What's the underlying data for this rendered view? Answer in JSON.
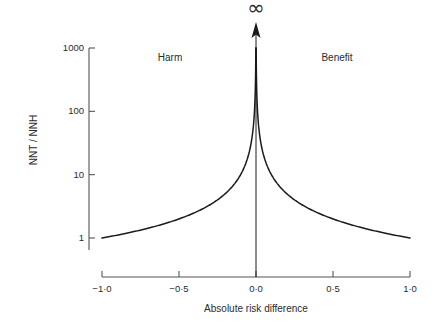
{
  "chart_data": {
    "type": "line",
    "title": "",
    "xlabel": "Absolute risk difference",
    "ylabel": "NNT / NNH",
    "xlim": [
      -1.0,
      1.0
    ],
    "ylim": [
      1,
      1000
    ],
    "yscale": "log",
    "grid": false,
    "legend": "none",
    "relationship": "NNT = 1 / |absolute risk difference|",
    "x_ticks": [
      {
        "value": -1.0,
        "label": "−1·0"
      },
      {
        "value": -0.5,
        "label": "−0·5"
      },
      {
        "value": 0.0,
        "label": "0·0"
      },
      {
        "value": 0.5,
        "label": "0·5"
      },
      {
        "value": 1.0,
        "label": "1·0"
      }
    ],
    "y_ticks": [
      {
        "value": 1,
        "label": "1"
      },
      {
        "value": 10,
        "label": "10"
      },
      {
        "value": 100,
        "label": "100"
      },
      {
        "value": 1000,
        "label": "1000"
      }
    ],
    "series": [
      {
        "name": "Harm branch",
        "points": [
          {
            "x": -1.0,
            "y": 1.0
          },
          {
            "x": -0.9,
            "y": 1.11
          },
          {
            "x": -0.8,
            "y": 1.25
          },
          {
            "x": -0.7,
            "y": 1.43
          },
          {
            "x": -0.6,
            "y": 1.67
          },
          {
            "x": -0.5,
            "y": 2.0
          },
          {
            "x": -0.4,
            "y": 2.5
          },
          {
            "x": -0.3,
            "y": 3.33
          },
          {
            "x": -0.2,
            "y": 5.0
          },
          {
            "x": -0.1,
            "y": 10.0
          },
          {
            "x": -0.05,
            "y": 20.0
          },
          {
            "x": -0.02,
            "y": 50.0
          },
          {
            "x": -0.01,
            "y": 100.0
          },
          {
            "x": -0.005,
            "y": 200.0
          },
          {
            "x": -0.002,
            "y": 500.0
          },
          {
            "x": -0.001,
            "y": 1000.0
          }
        ]
      },
      {
        "name": "Benefit branch",
        "points": [
          {
            "x": 0.001,
            "y": 1000.0
          },
          {
            "x": 0.002,
            "y": 500.0
          },
          {
            "x": 0.005,
            "y": 200.0
          },
          {
            "x": 0.01,
            "y": 100.0
          },
          {
            "x": 0.02,
            "y": 50.0
          },
          {
            "x": 0.05,
            "y": 20.0
          },
          {
            "x": 0.1,
            "y": 10.0
          },
          {
            "x": 0.2,
            "y": 5.0
          },
          {
            "x": 0.3,
            "y": 3.33
          },
          {
            "x": 0.4,
            "y": 2.5
          },
          {
            "x": 0.5,
            "y": 2.0
          },
          {
            "x": 0.6,
            "y": 1.67
          },
          {
            "x": 0.7,
            "y": 1.43
          },
          {
            "x": 0.8,
            "y": 1.25
          },
          {
            "x": 0.9,
            "y": 1.11
          },
          {
            "x": 1.0,
            "y": 1.0
          }
        ]
      }
    ],
    "annotations": [
      {
        "name": "harm-region-label",
        "text": "Harm",
        "x": -0.5,
        "y": 700
      },
      {
        "name": "benefit-region-label",
        "text": "Benefit",
        "x": 0.55,
        "y": 700
      },
      {
        "name": "infinity-marker",
        "text": "∞",
        "x": 0.0,
        "y": 1000
      }
    ],
    "colors": {
      "curve": "#1a1a1a",
      "axis": "#555555",
      "text": "#2b2b2b",
      "background": "#ffffff"
    }
  }
}
